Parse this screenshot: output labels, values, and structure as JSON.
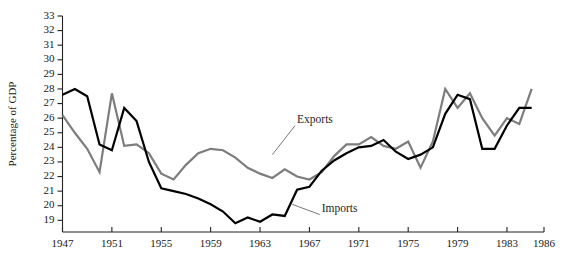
{
  "chart_data": {
    "type": "line",
    "title": "",
    "xlabel": "",
    "ylabel": "Percentage of GDP",
    "xlim": [
      1947,
      1986
    ],
    "ylim": [
      18.2,
      33
    ],
    "grid": false,
    "legend_position": "inline-annotations",
    "x": [
      1947,
      1948,
      1949,
      1950,
      1951,
      1952,
      1953,
      1954,
      1955,
      1956,
      1957,
      1958,
      1959,
      1960,
      1961,
      1962,
      1963,
      1964,
      1965,
      1966,
      1967,
      1968,
      1969,
      1970,
      1971,
      1972,
      1973,
      1974,
      1975,
      1976,
      1977,
      1978,
      1979,
      1980,
      1981,
      1982,
      1983,
      1984,
      1985
    ],
    "xticks": [
      1947,
      1951,
      1955,
      1959,
      1963,
      1967,
      1971,
      1975,
      1979,
      1983,
      1986
    ],
    "yticks": [
      19,
      20,
      21,
      22,
      23,
      24,
      25,
      26,
      27,
      28,
      29,
      30,
      31,
      32,
      33
    ],
    "series": [
      {
        "name": "Exports",
        "color": "#7d7d7d",
        "values": [
          26.2,
          25.0,
          23.9,
          22.3,
          27.7,
          24.1,
          24.2,
          23.6,
          22.2,
          21.8,
          22.8,
          23.6,
          23.9,
          23.8,
          23.3,
          22.6,
          22.2,
          21.9,
          22.5,
          22.0,
          21.8,
          22.3,
          23.4,
          24.2,
          24.2,
          24.7,
          24.1,
          23.9,
          24.4,
          22.6,
          24.4,
          28.0,
          26.7,
          27.7,
          26.0,
          24.8,
          26.0,
          25.6,
          28.0
        ]
      },
      {
        "name": "Imports",
        "color": "#000000",
        "values": [
          27.6,
          28.0,
          27.5,
          24.2,
          23.8,
          26.7,
          25.8,
          23.0,
          21.2,
          21.0,
          20.8,
          20.5,
          20.1,
          19.6,
          18.8,
          19.2,
          18.9,
          19.4,
          19.3,
          21.1,
          21.3,
          22.4,
          23.1,
          23.6,
          24.0,
          24.1,
          24.5,
          23.7,
          23.2,
          23.5,
          24.0,
          26.3,
          27.6,
          27.3,
          23.9,
          23.9,
          25.5,
          26.7,
          26.7
        ]
      }
    ],
    "annotations": [
      {
        "text": "Exports",
        "x": 1966.0,
        "y": 25.7,
        "leader_to_x": 1964.0,
        "leader_to_y": 23.5
      },
      {
        "text": "Imports",
        "x": 1968.0,
        "y": 19.6,
        "leader_to_x": 1965.6,
        "leader_to_y": 20.1
      }
    ]
  }
}
